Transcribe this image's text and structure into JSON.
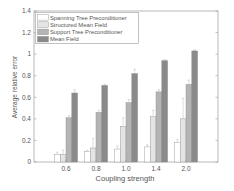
{
  "chart_data": {
    "type": "bar",
    "title": "",
    "xlabel": "Coupling strength",
    "ylabel": "Average relative error",
    "categories": [
      "0.6",
      "0.8",
      "1.0",
      "1.4",
      "2.0"
    ],
    "ylim": [
      0,
      1.4
    ],
    "yticks": [
      "0",
      "0.2",
      "0.4",
      "0.6",
      "0.8",
      "1",
      "1.2",
      "1.4"
    ],
    "grid": false,
    "legend_position": "upper-left",
    "series": [
      {
        "name": "Spanning Tree Preconditioner",
        "color": "#ffffff",
        "values": [
          0.07,
          0.1,
          0.12,
          0.14,
          0.18
        ],
        "err": [
          0.02,
          0.01,
          0.03,
          0.02,
          0.03
        ]
      },
      {
        "name": "Structured Mean Field",
        "color": "#e4e4e4",
        "values": [
          0.07,
          0.13,
          0.33,
          0.42,
          0.4
        ],
        "err": [
          0.04,
          0.09,
          0.08,
          0.06,
          0.19
        ]
      },
      {
        "name": "Support Tree Preconditioner",
        "color": "#b4b4b4",
        "values": [
          0.41,
          0.46,
          0.55,
          0.65,
          0.72
        ],
        "err": [
          0.02,
          0.02,
          0.03,
          0.02,
          0.04
        ]
      },
      {
        "name": "Mean Field",
        "color": "#8a8a8a",
        "values": [
          0.64,
          0.71,
          0.82,
          0.94,
          1.03
        ],
        "err": [
          0.03,
          0.01,
          0.04,
          0.01,
          0.01
        ]
      }
    ]
  }
}
